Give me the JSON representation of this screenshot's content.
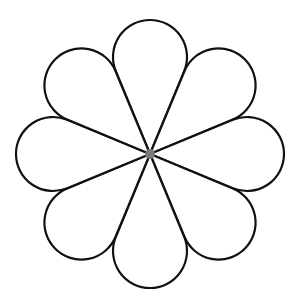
{
  "diagram": {
    "type": "flower",
    "petal_count": 8,
    "center": {
      "x": 150,
      "y": 154
    },
    "petal_length": 97,
    "petal_radius": 37,
    "colors": {
      "background": "#ffffff",
      "petal_fill": "#ffffff",
      "petal_stroke": "#111111",
      "center_dot": "#7a7a7a"
    },
    "petal_angles_deg": [
      0,
      45,
      90,
      135,
      180,
      225,
      270,
      315
    ]
  }
}
